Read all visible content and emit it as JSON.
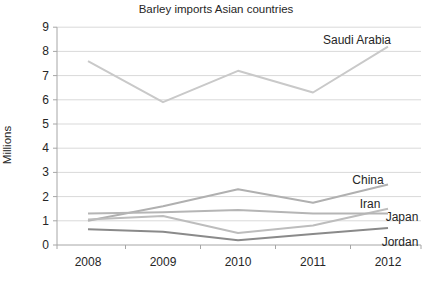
{
  "chart_data": {
    "type": "line",
    "title": "Barley imports Asian countries",
    "xlabel": "",
    "ylabel": "Millions",
    "categories": [
      "2008",
      "2009",
      "2010",
      "2011",
      "2012"
    ],
    "ylim": [
      0,
      9
    ],
    "yticks": [
      0,
      1,
      2,
      3,
      4,
      5,
      6,
      7,
      8,
      9
    ],
    "grid": true,
    "legend_position": "inline-labels-right",
    "series": [
      {
        "name": "Saudi Arabia",
        "values": [
          7.6,
          5.9,
          7.2,
          6.3,
          8.2
        ],
        "color": "#c9c9c9"
      },
      {
        "name": "China",
        "values": [
          1.0,
          1.6,
          2.3,
          1.75,
          2.5
        ],
        "color": "#b0b0b0"
      },
      {
        "name": "Iran",
        "values": [
          1.05,
          1.2,
          0.5,
          0.8,
          1.5
        ],
        "color": "#bdbdbd"
      },
      {
        "name": "Japan",
        "values": [
          1.3,
          1.35,
          1.45,
          1.3,
          1.3
        ],
        "color": "#b5b5b5"
      },
      {
        "name": "Jordan",
        "values": [
          0.65,
          0.55,
          0.2,
          0.45,
          0.7
        ],
        "color": "#8a8a8a"
      }
    ],
    "colors": {
      "background": "#ffffff",
      "gridline": "#d9d9d9",
      "axis": "#a6a6a6",
      "text": "#262626"
    }
  }
}
